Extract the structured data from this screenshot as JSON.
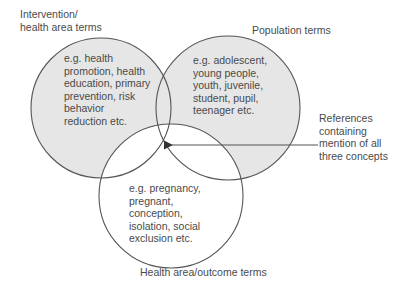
{
  "colors": {
    "fill": "#e6e6e6",
    "stroke": "#555555",
    "text": "#4a4a4a",
    "background": "#ffffff"
  },
  "labels": {
    "intervention": "Intervention/\nhealth area terms",
    "population": "Population terms",
    "outcome": "Health area/outcome terms",
    "callout": "References\ncontaining\nmention of all\nthree concepts"
  },
  "circles": {
    "intervention": {
      "examples": "e.g. health\npromotion, health\neducation, primary\nprevention, risk\nbehavior\nreduction etc."
    },
    "population": {
      "examples": "e.g. adolescent,\nyoung people,\nyouth, juvenile,\nstudent, pupil,\nteenager etc."
    },
    "outcome": {
      "examples": "e.g. pregnancy,\npregnant,\nconception,\nisolation, social\nexclusion etc."
    }
  }
}
